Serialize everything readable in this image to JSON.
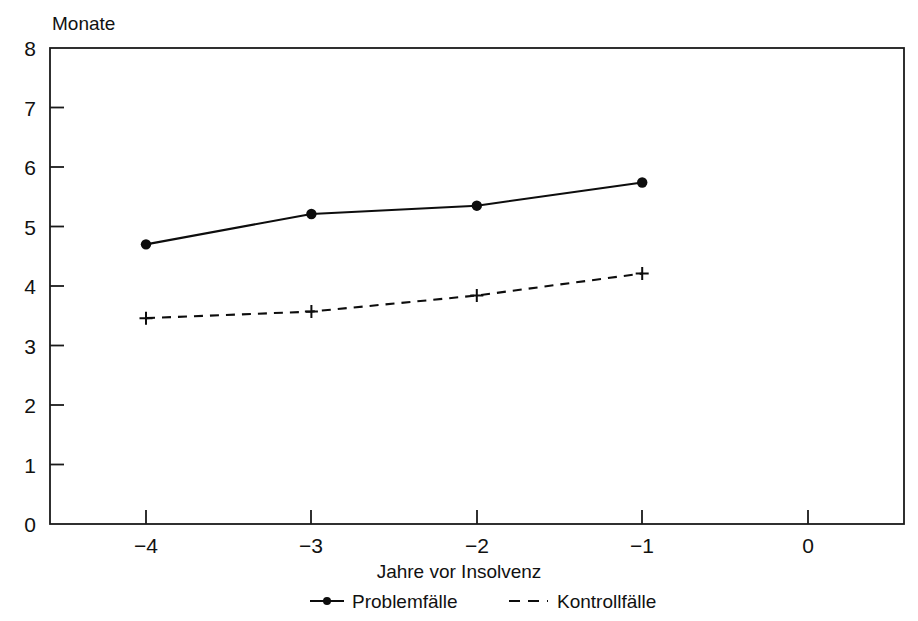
{
  "chart_data": {
    "type": "line",
    "title": "",
    "subtitle": "",
    "xlabel": "Jahre vor Insolvenz",
    "ylabel": "Monate",
    "ylabel_position": "top-left-above-axis",
    "x": [
      -4,
      -3,
      -2,
      -1
    ],
    "categories": [
      "-4",
      "-3",
      "-2",
      "-1"
    ],
    "xlim": [
      -4.55,
      0.6
    ],
    "ylim": [
      0,
      8
    ],
    "xticks": [
      -4,
      -3,
      -2,
      -1,
      0
    ],
    "xticklabels": [
      "−4",
      "−3",
      "−2",
      "−1",
      "0"
    ],
    "yticks": [
      0,
      1,
      2,
      3,
      4,
      5,
      6,
      7,
      8
    ],
    "yticklabels": [
      "0",
      "1",
      "2",
      "3",
      "4",
      "5",
      "6",
      "7",
      "8"
    ],
    "grid": false,
    "frame": "box",
    "legend_position": "below-axis-center",
    "series": [
      {
        "name": "Problemfälle",
        "values": [
          4.7,
          5.21,
          5.35,
          5.74
        ],
        "style": "solid",
        "marker": "circle",
        "color": "#0d0d0d"
      },
      {
        "name": "Kontrollfälle",
        "values": [
          3.46,
          3.57,
          3.84,
          4.21
        ],
        "style": "dashed",
        "marker": "plus",
        "color": "#0d0d0d"
      }
    ]
  },
  "axes": {
    "y_unit_label": "Monate",
    "x_axis_label": "Jahre vor Insolvenz",
    "y_tick_0": "0",
    "y_tick_1": "1",
    "y_tick_2": "2",
    "y_tick_3": "3",
    "y_tick_4": "4",
    "y_tick_5": "5",
    "y_tick_6": "6",
    "y_tick_7": "7",
    "y_tick_8": "8",
    "x_tick_m4": "−4",
    "x_tick_m3": "−3",
    "x_tick_m2": "−2",
    "x_tick_m1": "−1",
    "x_tick_0": "0"
  },
  "legend": {
    "entries": [
      {
        "label": "Problemfälle",
        "marker": "circle",
        "line": "solid"
      },
      {
        "label": "Kontrollfälle",
        "marker": "none",
        "line": "dashed"
      }
    ],
    "problemfaelle_label": "Problemfälle",
    "kontrollfaelle_label": "Kontrollfälle"
  },
  "colors": {
    "line": "#0d0d0d",
    "frame": "#1a1a1a",
    "text": "#111111",
    "background": "#ffffff"
  }
}
